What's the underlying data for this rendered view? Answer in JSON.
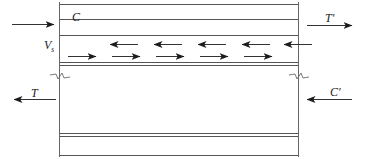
{
  "figure": {
    "type": "engineering-section-diagram",
    "background_color": "#ffffff",
    "line_color": "#4d4d4d",
    "arrow_color": "#1c1c1c",
    "text_color": "#1c1c1c"
  },
  "labels": {
    "top_left": {
      "name": "C",
      "text": "C",
      "prime": "",
      "subscript": "",
      "arrow_direction": "right"
    },
    "top_right": {
      "name": "T-prime",
      "text": "T",
      "prime": "′",
      "subscript": "",
      "arrow_direction": "right"
    },
    "bottom_left": {
      "name": "T",
      "text": "T",
      "prime": "",
      "subscript": "",
      "arrow_direction": "left"
    },
    "bottom_right": {
      "name": "C-prime",
      "text": "C",
      "prime": "′",
      "subscript": "",
      "arrow_direction": "left"
    },
    "interface": {
      "name": "Vs",
      "text": "V",
      "prime": "",
      "subscript": "s",
      "arrow_direction": "none"
    }
  },
  "force_arrows": {
    "top_left_arrow": {
      "x1": 12,
      "y1": 24,
      "x2": 57,
      "y2": 24,
      "head": "right"
    },
    "top_right_arrow": {
      "x1": 303,
      "y1": 25,
      "x2": 352,
      "y2": 25,
      "head": "right"
    },
    "bottom_left_arrow": {
      "x1": 56,
      "y1": 99,
      "x2": 12,
      "y2": 99,
      "head": "left"
    },
    "bottom_right_arrow": {
      "x1": 352,
      "y1": 99,
      "x2": 303,
      "y2": 99,
      "head": "left"
    }
  },
  "interface_arrows": {
    "upper_row": {
      "direction": "left",
      "y": 44,
      "count": 5,
      "x_starts": [
        108,
        152,
        196,
        240,
        284
      ],
      "length": 30
    },
    "lower_row": {
      "direction": "right",
      "y": 56,
      "count": 5,
      "x_starts": [
        68,
        112,
        156,
        200,
        244
      ],
      "length": 30
    }
  },
  "geometry": {
    "left_edge_x": 59,
    "right_edge_x": 298,
    "horizontal_lines": [
      {
        "name": "top-outer",
        "y": 4,
        "x1": 59,
        "x2": 298,
        "weight": "thin"
      },
      {
        "name": "slab-top",
        "y": 19,
        "x1": 59,
        "x2": 298,
        "weight": "thin"
      },
      {
        "name": "slab-bottom",
        "y": 35,
        "x1": 59,
        "x2": 298,
        "weight": "thin"
      },
      {
        "name": "interface-upper",
        "y": 62,
        "x1": 59,
        "x2": 298,
        "weight": "thin"
      },
      {
        "name": "interface-lower",
        "y": 65,
        "x1": 59,
        "x2": 298,
        "weight": "thin"
      },
      {
        "name": "web-bottom-upper",
        "y": 133,
        "x1": 59,
        "x2": 298,
        "weight": "thin"
      },
      {
        "name": "web-bottom-lower",
        "y": 136,
        "x1": 59,
        "x2": 298,
        "weight": "thin"
      },
      {
        "name": "bottom-outer",
        "y": 155,
        "x1": 59,
        "x2": 298,
        "weight": "thin"
      }
    ],
    "vertical_lines": [
      {
        "name": "left-section-line",
        "x": 59,
        "y1": 2,
        "y2": 157
      },
      {
        "name": "right-section-line",
        "x": 298,
        "y1": 2,
        "y2": 157
      }
    ],
    "break_symbols": [
      {
        "name": "left-break",
        "cx": 59,
        "cy": 76
      },
      {
        "name": "right-break",
        "cx": 298,
        "cy": 76
      }
    ]
  }
}
